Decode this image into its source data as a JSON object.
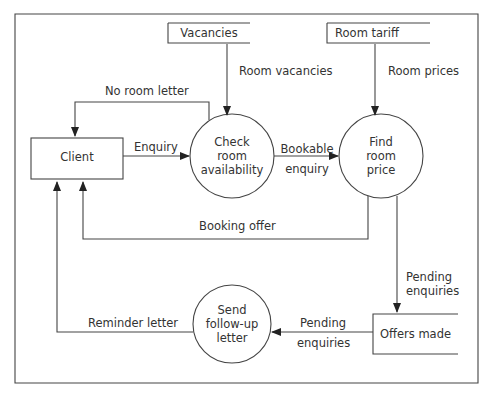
{
  "diagram": {
    "type": "data-flow-diagram",
    "entities": [
      {
        "id": "client",
        "label": "Client"
      }
    ],
    "processes": [
      {
        "id": "check",
        "label_lines": [
          "Check",
          "room",
          "availability"
        ]
      },
      {
        "id": "find",
        "label_lines": [
          "Find",
          "room",
          "price"
        ]
      },
      {
        "id": "send",
        "label_lines": [
          "Send",
          "follow-up",
          "letter"
        ]
      }
    ],
    "stores": [
      {
        "id": "vacancies",
        "label": "Vacancies"
      },
      {
        "id": "tariff",
        "label": "Room tariff"
      },
      {
        "id": "offers",
        "label": "Offers made"
      }
    ],
    "flows": {
      "room_vacancies": "Room vacancies",
      "room_prices": "Room prices",
      "no_room_letter": "No room letter",
      "enquiry": "Enquiry",
      "bookable": [
        "Bookable",
        "enquiry"
      ],
      "booking_offer": "Booking offer",
      "pending_down": [
        "Pending",
        "enquiries"
      ],
      "pending_left": [
        "Pending",
        "enquiries"
      ],
      "reminder_letter": "Reminder letter"
    }
  }
}
